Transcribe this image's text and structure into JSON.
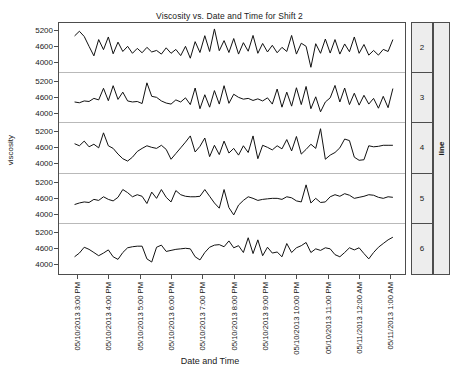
{
  "chart_data": {
    "type": "line",
    "title": "Viscosity vs. Date and Time for Shift 2",
    "xlabel": "Date and Time",
    "ylabel": "viscosity",
    "grid": false,
    "legend_position": "right-strip",
    "panel_variable": "line",
    "ylim": [
      3600,
      5500
    ],
    "yticks": [
      4000,
      4600,
      5200
    ],
    "ytick_labels": [
      "4000",
      "4600",
      "5200"
    ],
    "x": [
      "05/10/2013 3:00 PM",
      "05/10/2013 4:00 PM",
      "05/10/2013 5:00 PM",
      "05/10/2013 6:00 PM",
      "05/10/2013 7:00 PM",
      "05/10/2013 8:00 PM",
      "05/10/2013 9:00 PM",
      "05/10/2013 10:00 PM",
      "05/10/2013 11:00 PM",
      "05/11/2013 12:00 AM",
      "05/11/2013 1:00 AM"
    ],
    "xtick_positions": [
      0.055,
      0.145,
      0.235,
      0.325,
      0.415,
      0.505,
      0.595,
      0.685,
      0.775,
      0.865,
      0.955
    ],
    "panels": [
      {
        "label": "2",
        "values": [
          5000,
          5180,
          4980,
          4600,
          4230,
          4860,
          4470,
          4960,
          4310,
          4760,
          4400,
          4600,
          4330,
          4520,
          4350,
          4560,
          4380,
          4440,
          4300,
          4540,
          4330,
          4480,
          4240,
          4600,
          4140,
          4780,
          4360,
          5010,
          4400,
          5270,
          4430,
          4820,
          4360,
          4900,
          4300,
          4740,
          4410,
          5020,
          4330,
          4710,
          4380,
          4640,
          4350,
          4560,
          4400,
          5020,
          4300,
          4720,
          4600,
          3790,
          4700,
          4330,
          4880,
          4340,
          4860,
          4300,
          4690,
          4390,
          4960,
          4330,
          4670,
          4260,
          4440,
          4260,
          4480,
          4400,
          4860
        ]
      },
      {
        "label": "3",
        "values": [
          4380,
          4350,
          4420,
          4400,
          4520,
          4460,
          4910,
          4430,
          5010,
          4480,
          4760,
          4420,
          4380,
          4400,
          4320,
          5120,
          4600,
          4560,
          4420,
          4340,
          4300,
          4460,
          4380,
          4540,
          4280,
          4920,
          4120,
          4660,
          4180,
          4820,
          4300,
          5010,
          4330,
          4680,
          4560,
          4490,
          4520,
          4440,
          4500,
          4420,
          4540,
          4300,
          4880,
          4180,
          4760,
          4220,
          4930,
          4280,
          4980,
          4120,
          4580,
          4000,
          4380,
          4540,
          5020,
          4380,
          4920,
          4280,
          4720,
          4260,
          4640,
          4300,
          4520,
          4140,
          4600,
          4160,
          4900
        ]
      },
      {
        "label": "4",
        "values": [
          4700,
          4620,
          4800,
          4580,
          4680,
          4540,
          5120,
          4620,
          4520,
          4300,
          4120,
          4030,
          4180,
          4400,
          4520,
          4620,
          4560,
          4520,
          4640,
          4480,
          4100,
          4320,
          4540,
          4760,
          5000,
          4380,
          4600,
          4920,
          4200,
          4640,
          4280,
          4800,
          4340,
          4520,
          4260,
          4620,
          4360,
          5000,
          4120,
          4640,
          4560,
          4460,
          4620,
          4500,
          4860,
          4420,
          4980,
          4300,
          4480,
          4680,
          4520,
          5280,
          4100,
          4260,
          4360,
          4540,
          4880,
          4820,
          4180,
          4060,
          4080,
          4620,
          4580,
          4600,
          4640,
          4640,
          4640
        ]
      },
      {
        "label": "5",
        "values": [
          4320,
          4380,
          4420,
          4400,
          4520,
          4480,
          4620,
          4520,
          4460,
          4600,
          4900,
          4780,
          4620,
          4700,
          4640,
          4360,
          4800,
          4560,
          4900,
          4600,
          4420,
          4860,
          4700,
          4640,
          4620,
          4620,
          4640,
          4900,
          4640,
          4380,
          4180,
          4900,
          4200,
          3920,
          4300,
          4480,
          4620,
          4560,
          4480,
          4520,
          4540,
          4560,
          4560,
          4520,
          4620,
          4580,
          4460,
          4420,
          5080,
          4380,
          4560,
          4400,
          4420,
          4620,
          4700,
          4640,
          4740,
          4680,
          4560,
          4600,
          4640,
          4700,
          4680,
          4600,
          4560,
          4620,
          4600
        ]
      },
      {
        "label": "6",
        "values": [
          4260,
          4400,
          4620,
          4540,
          4420,
          4300,
          4400,
          4520,
          4260,
          4160,
          4420,
          4600,
          4640,
          4660,
          4660,
          4180,
          4060,
          4620,
          4700,
          4460,
          4500,
          4540,
          4560,
          4580,
          4560,
          4260,
          4140,
          4420,
          4620,
          4700,
          4720,
          4640,
          4860,
          4600,
          4680,
          4420,
          4980,
          4380,
          4900,
          4300,
          4620,
          4400,
          4440,
          4260,
          4760,
          4420,
          4600,
          4680,
          4800,
          4420,
          4560,
          4500,
          4600,
          4560,
          4340,
          4260,
          4420,
          4600,
          4520,
          4600,
          4380,
          4180,
          4420,
          4620,
          4760,
          4900,
          5000
        ]
      }
    ]
  }
}
